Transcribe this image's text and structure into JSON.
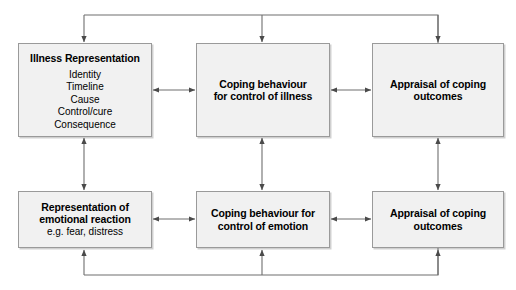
{
  "diagram": {
    "canvas": {
      "width": 516,
      "height": 290,
      "background": "#ffffff"
    },
    "style": {
      "box_fill": "#f1f1f1",
      "box_border": "#9a9a9a",
      "line_color": "#6e6e6e",
      "text_color": "#000000"
    },
    "nodes": [
      {
        "id": "illness-representation",
        "title": "Illness Representation",
        "items": [
          "Identity",
          "Timeline",
          "Cause",
          "Control/cure",
          "Consequence"
        ]
      },
      {
        "id": "coping-behaviour-illness",
        "title_line1": "Coping behaviour",
        "title_line2": "for control of illness"
      },
      {
        "id": "appraisal-of-coping-outcomes-top",
        "title_line1": "Appraisal of coping",
        "title_line2": "outcomes"
      },
      {
        "id": "representation-of-emotional-reaction",
        "title_line1": "Representation of",
        "title_line2": "emotional reaction",
        "subtitle": "e.g. fear, distress"
      },
      {
        "id": "coping-behaviour-emotion",
        "title_line1": "Coping behaviour for",
        "title_line2": "control of emotion"
      },
      {
        "id": "appraisal-of-coping-outcomes-bottom",
        "title_line1": "Appraisal of coping",
        "title_line2": "outcomes"
      }
    ],
    "connectors": [
      {
        "name": "illness-to-coping-illness",
        "kind": "horizontal-bidirectional"
      },
      {
        "name": "coping-illness-to-appraisal-top",
        "kind": "horizontal-bidirectional"
      },
      {
        "name": "emotional-to-coping-emotion",
        "kind": "horizontal-bidirectional"
      },
      {
        "name": "coping-emotion-to-appraisal-bottom",
        "kind": "horizontal-bidirectional"
      },
      {
        "name": "illness-to-emotional",
        "kind": "vertical-bidirectional"
      },
      {
        "name": "coping-illness-to-coping-emotion",
        "kind": "vertical-bidirectional"
      },
      {
        "name": "appraisal-top-to-appraisal-bottom",
        "kind": "vertical-bidirectional"
      },
      {
        "name": "top-feedback-bus",
        "kind": "feedback-loop-top"
      },
      {
        "name": "bottom-feedback-bus",
        "kind": "feedback-loop-bottom"
      }
    ]
  }
}
